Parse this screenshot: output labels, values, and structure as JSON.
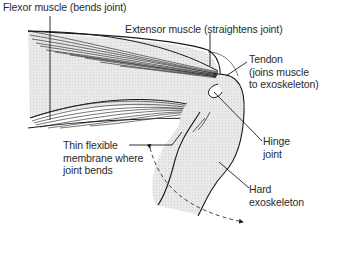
{
  "diagram": {
    "labels": {
      "flexor": "Flexor muscle (bends joint)",
      "extensor": "Extensor muscle (straightens joint)",
      "tendon_line1": "Tendon",
      "tendon_line2": "(joins muscle",
      "tendon_line3": "to exoskeleton)",
      "hinge_line1": "Hinge",
      "hinge_line2": "joint",
      "membrane_line1": "Thin flexible",
      "membrane_line2": "membrane where",
      "membrane_line3": "joint bends",
      "exo_line1": "Hard",
      "exo_line2": "exoskeleton"
    },
    "colors": {
      "outline": "#1a1a1a",
      "fill": "#e6e6e6",
      "text": "#2a2a2a",
      "background": "#ffffff"
    }
  }
}
